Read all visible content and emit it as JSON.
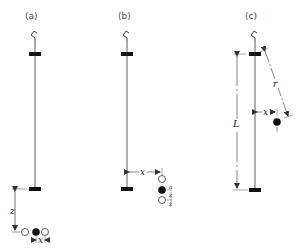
{
  "diagram": {
    "panels": [
      {
        "id": "a",
        "label": "(a)",
        "dimensions": {
          "vertical": "z",
          "horizontal": "x"
        },
        "description": "Pendulum rod with bottom bar; row of three bobs (open, filled, open) located distance z below the bottom bar, spacing x"
      },
      {
        "id": "b",
        "label": "(b)",
        "dimensions": {
          "horizontal": "x",
          "upper_offset": "z",
          "lower_offset": "z"
        },
        "small_labels": [
          "a",
          "z",
          "z"
        ],
        "description": "Pendulum rod with three vertically stacked bobs (open, filled, open) offset horizontally by x from the rod"
      },
      {
        "id": "c",
        "label": "(c)",
        "dimensions": {
          "length": "L",
          "radius": "r",
          "horizontal": "x"
        },
        "description": "Pendulum rod of length L between two bars; a filled bob at horizontal distance x from the rod and distance r from the top bar"
      }
    ],
    "colors": {
      "line": "#333333",
      "bar": "#111111",
      "label": "#444444",
      "background": "#ffffff"
    }
  }
}
